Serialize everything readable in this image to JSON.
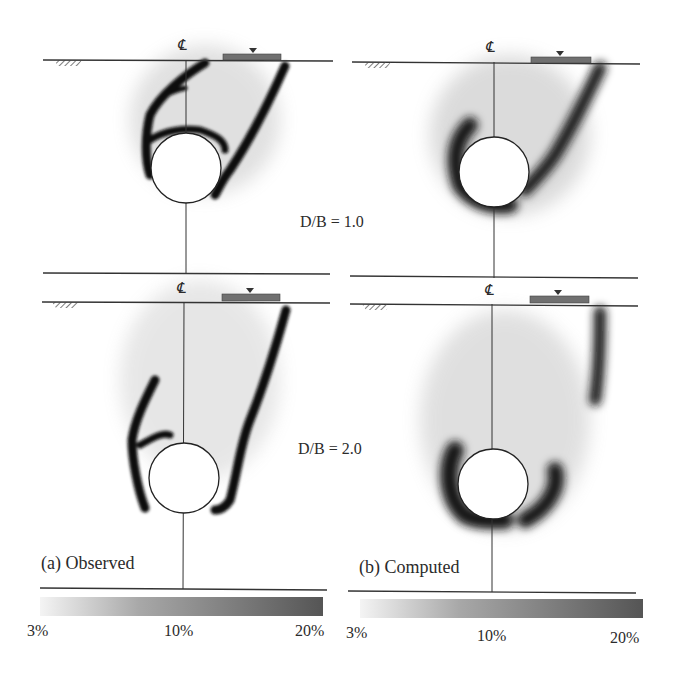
{
  "figure": {
    "panels": [
      {
        "id": "a",
        "caption": "(a) Observed"
      },
      {
        "id": "b",
        "caption": "(b) Computed"
      }
    ],
    "rows": [
      {
        "label": "D/B = 1.0"
      },
      {
        "label": "D/B = 2.0"
      }
    ],
    "centerline_symbol": "℄",
    "colorbar": {
      "ticks": [
        "3%",
        "10%",
        "20%"
      ],
      "color_start": "#f2f2f2",
      "color_end": "#555555"
    },
    "colors": {
      "footing": "#707070",
      "strain_dark": "#141414",
      "line": "#333333"
    }
  }
}
